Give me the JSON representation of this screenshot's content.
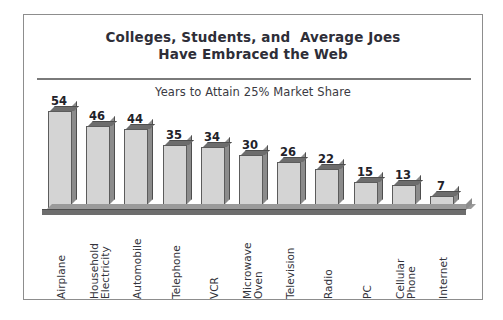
{
  "figure": {
    "title_line_1": "Colleges, Students, and  Average Joes",
    "title_line_2": "Have Embraced the Web",
    "subtitle": "Years to Attain 25% Market Share",
    "border_color": "#8d8d8d",
    "rule_color": "#7a7a7a"
  },
  "chart_data": {
    "type": "bar",
    "title": "Colleges, Students, and  Average Joes Have Embraced the Web",
    "subtitle": "Years to Attain 25% Market Share",
    "xlabel": "",
    "ylabel": "Years to Attain 25% Market Share",
    "ylim": [
      0,
      54
    ],
    "grid": false,
    "legend": false,
    "orientation": "vertical",
    "style": "3d-bars",
    "bar_face_color": "#d4d4d4",
    "bar_top_color": "#6d6d6d",
    "bar_side_color": "#8c8c8c",
    "bar_outline_color": "#5c5c5c",
    "categories": [
      "Airplane",
      "Household\nElectricity",
      "Automobile",
      "Telephone",
      "VCR",
      "Microwave\nOven",
      "Television",
      "Radio",
      "PC",
      "Cellular\nPhone",
      "Internet"
    ],
    "values": [
      54,
      46,
      44,
      35,
      34,
      30,
      26,
      22,
      15,
      13,
      7
    ],
    "value_labels": [
      "54",
      "46",
      "44",
      "35",
      "34",
      "30",
      "26",
      "22",
      "15",
      "13",
      "7"
    ]
  },
  "bars": [
    {
      "label": "Airplane",
      "value_label": "54"
    },
    {
      "label": "Household\nElectricity",
      "value_label": "46"
    },
    {
      "label": "Automobile",
      "value_label": "44"
    },
    {
      "label": "Telephone",
      "value_label": "35"
    },
    {
      "label": "VCR",
      "value_label": "34"
    },
    {
      "label": "Microwave\nOven",
      "value_label": "30"
    },
    {
      "label": "Television",
      "value_label": "26"
    },
    {
      "label": "Radio",
      "value_label": "22"
    },
    {
      "label": "PC",
      "value_label": "15"
    },
    {
      "label": "Cellular\nPhone",
      "value_label": "13"
    },
    {
      "label": "Internet",
      "value_label": "7"
    }
  ]
}
